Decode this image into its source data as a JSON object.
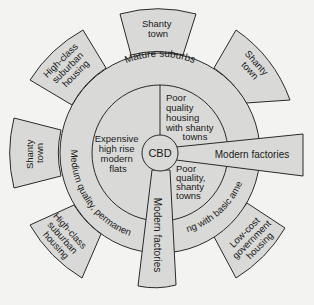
{
  "diagram": {
    "type": "urban-land-use-model",
    "colors": {
      "background": "#f3f3f1",
      "zone_fill": "#d9d9d7",
      "outline": "#2a2a2a",
      "text": "#1a1a1a"
    },
    "center": {
      "label": "CBD"
    },
    "inner_ring": {
      "sectors": [
        {
          "id": "poor-quality-housing-shanty",
          "lines": [
            "Poor",
            "quality",
            "housing",
            "with shanty",
            "towns"
          ]
        },
        {
          "id": "poor-quality-shanty",
          "lines": [
            "Poor",
            "quality,",
            "shanty",
            "towns"
          ]
        },
        {
          "id": "expensive-flats",
          "lines": [
            "Expensive",
            "high rise",
            "modern",
            "flats"
          ]
        }
      ]
    },
    "middle_ring": {
      "arcs": [
        {
          "id": "mature-suburbs",
          "label": "Mature suburbs"
        },
        {
          "id": "medium-quality-permanent",
          "label": "Medium quality, permanent"
        },
        {
          "id": "housing-basic-amenities",
          "label": "housing with basic amenities"
        }
      ]
    },
    "wedges": [
      {
        "id": "modern-factories-east",
        "label": "Modern factories"
      },
      {
        "id": "modern-factories-south",
        "label": "Modern factories"
      }
    ],
    "outer_blocks": [
      {
        "id": "shanty-town-north",
        "lines": [
          "Shanty",
          "town"
        ]
      },
      {
        "id": "shanty-town-northeast",
        "lines": [
          "Shanty",
          "town"
        ]
      },
      {
        "id": "high-class-northwest",
        "lines": [
          "High-class",
          "suburban",
          "housing"
        ]
      },
      {
        "id": "shanty-town-west",
        "lines": [
          "Shanty",
          "town"
        ]
      },
      {
        "id": "high-class-southwest",
        "lines": [
          "High-class",
          "suburban",
          "housing"
        ]
      },
      {
        "id": "low-cost-southeast",
        "lines": [
          "Low-cost",
          "government",
          "housing"
        ]
      }
    ]
  }
}
